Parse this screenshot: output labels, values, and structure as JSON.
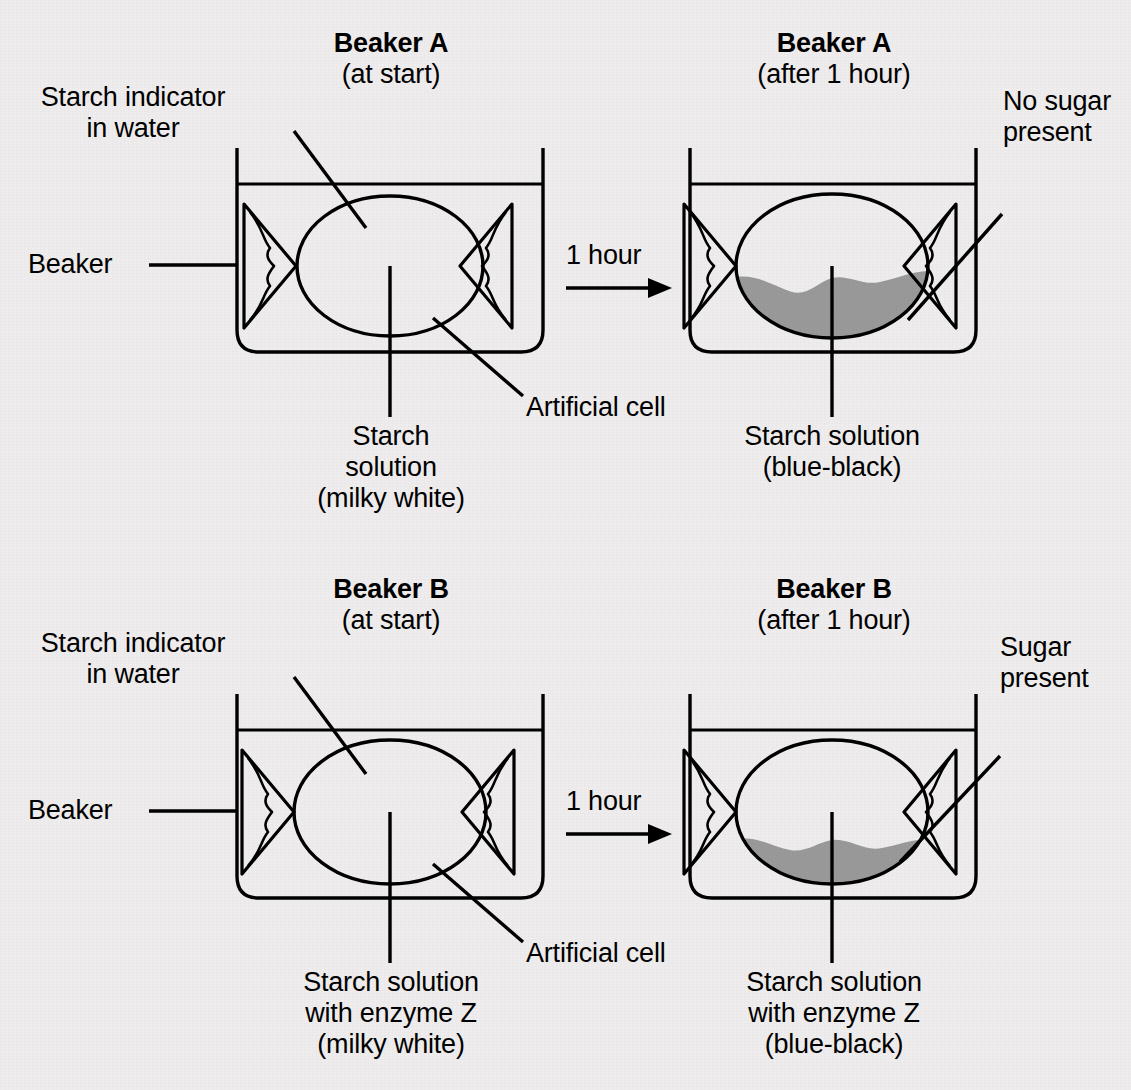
{
  "diagram": {
    "title_semantics": "enzyme-diffusion-artificial-cell-experiment",
    "background_color": "#eeecec",
    "line_color": "#000000",
    "shade_color": "#999999"
  },
  "panels": [
    {
      "id": "beaker-a-start",
      "title_bold": "Beaker A",
      "title_sub": "(at start)",
      "labels": {
        "starch_indicator": "Starch indicator\nin water",
        "beaker": "Beaker",
        "solution": "Starch\nsolution\n(milky white)",
        "cell": "Artificial cell"
      },
      "cell_shaded": false
    },
    {
      "id": "beaker-a-after",
      "title_bold": "Beaker A",
      "title_sub": "(after 1 hour)",
      "labels": {
        "result": "No sugar\npresent",
        "solution": "Starch solution\n(blue-black)"
      },
      "cell_shaded": true
    },
    {
      "id": "beaker-b-start",
      "title_bold": "Beaker B",
      "title_sub": "(at start)",
      "labels": {
        "starch_indicator": "Starch indicator\nin water",
        "beaker": "Beaker",
        "solution": "Starch solution\nwith enzyme Z\n(milky white)",
        "cell": "Artificial cell"
      },
      "cell_shaded": false
    },
    {
      "id": "beaker-b-after",
      "title_bold": "Beaker B",
      "title_sub": "(after 1 hour)",
      "labels": {
        "result": "Sugar\npresent",
        "solution": "Starch solution\nwith enzyme Z\n(blue-black)"
      },
      "cell_shaded": true
    }
  ],
  "arrows": {
    "top_label": "1 hour",
    "bottom_label": "1 hour"
  }
}
